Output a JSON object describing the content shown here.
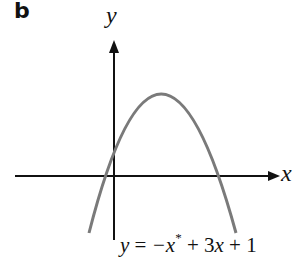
{
  "panel_label": "b",
  "axes": {
    "x_label": "x",
    "y_label": "y"
  },
  "curve": {
    "equation_parts": {
      "lhs": "y",
      "eq": " = ",
      "neg_x": "−x",
      "power": "*",
      "rest_a": " + 3",
      "x2": "x",
      "rest_b": " + 1"
    },
    "color": "#7a7a7a"
  },
  "colors": {
    "axis": "#111111",
    "curve": "#7a7a7a"
  }
}
